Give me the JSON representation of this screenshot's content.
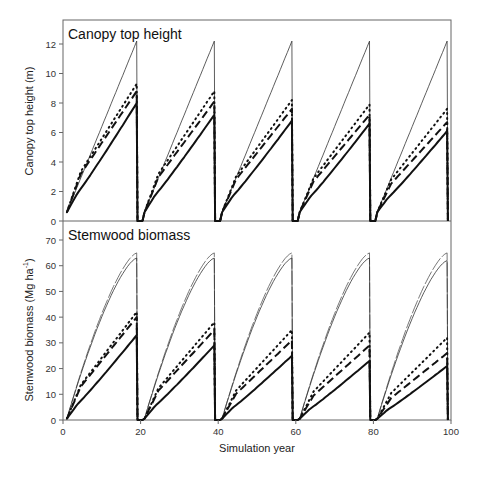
{
  "chart_data": [
    {
      "type": "line",
      "title": "Canopy top height",
      "xlabel": "",
      "ylabel": "Canopy top height (m)",
      "xlim": [
        0,
        100
      ],
      "ylim": [
        0,
        13
      ],
      "yticks": [
        0,
        2,
        4,
        6,
        8,
        10,
        12
      ],
      "grid": false,
      "rotation_years": [
        [
          1,
          19
        ],
        [
          21,
          39
        ],
        [
          41,
          59
        ],
        [
          61,
          79
        ],
        [
          81,
          99
        ]
      ],
      "series": [
        {
          "name": "thin solid",
          "style": "thin-solid",
          "start": 0.6,
          "end": [
            12.2,
            12.2,
            12.2,
            12.2,
            12.2
          ],
          "shape": "linear"
        },
        {
          "name": "dotted",
          "style": "dotted",
          "start": 0.6,
          "end": [
            9.3,
            8.8,
            8.2,
            7.9,
            7.6
          ],
          "shape": "early"
        },
        {
          "name": "dashed",
          "style": "dashed",
          "start": 0.6,
          "end": [
            8.8,
            8.1,
            7.6,
            7.2,
            6.7
          ],
          "shape": "early"
        },
        {
          "name": "thick solid",
          "style": "thick-solid",
          "start": 0.6,
          "end": [
            8.0,
            7.2,
            6.8,
            6.6,
            6.1
          ],
          "shape": "late"
        }
      ]
    },
    {
      "type": "line",
      "title": "Stemwood biomass",
      "xlabel": "Simulation year",
      "ylabel": "Stemwood biomass (Mg ha",
      "ylabel_sup": "-1",
      "ylabel_close": ")",
      "xlim": [
        0,
        100
      ],
      "ylim": [
        0,
        70
      ],
      "xticks": [
        0,
        20,
        40,
        60,
        80,
        100
      ],
      "yticks": [
        0,
        10,
        20,
        30,
        40,
        50,
        60,
        70
      ],
      "grid": false,
      "rotation_years": [
        [
          1,
          19
        ],
        [
          21,
          39
        ],
        [
          41,
          59
        ],
        [
          61,
          79
        ],
        [
          81,
          99
        ]
      ],
      "series": [
        {
          "name": "thin dashed",
          "style": "thin-dashed",
          "start": 0.5,
          "end": [
            65,
            65,
            65,
            65,
            65
          ],
          "shape": "concave"
        },
        {
          "name": "thin solid",
          "style": "thin-solid",
          "start": 0.5,
          "end": [
            63,
            63,
            63,
            63,
            62
          ],
          "shape": "concave"
        },
        {
          "name": "dotted",
          "style": "dotted",
          "start": 0.5,
          "end": [
            42,
            38,
            35,
            34,
            32
          ],
          "shape": "early"
        },
        {
          "name": "dashed",
          "style": "dashed",
          "start": 0.5,
          "end": [
            40,
            35,
            31,
            29,
            26
          ],
          "shape": "early"
        },
        {
          "name": "thick solid",
          "style": "thick-solid",
          "start": 0.5,
          "end": [
            33,
            29,
            25,
            23,
            21
          ],
          "shape": "late"
        }
      ]
    }
  ],
  "labels": {
    "top_title": "Canopy top height",
    "bottom_title": "Stemwood biomass",
    "top_ylabel": "Canopy top height (m)",
    "bottom_ylabel": "Stemwood biomass (Mg ha",
    "bottom_ylabel_sup": "-1",
    "bottom_ylabel_close": ")",
    "xlabel": "Simulation year"
  }
}
